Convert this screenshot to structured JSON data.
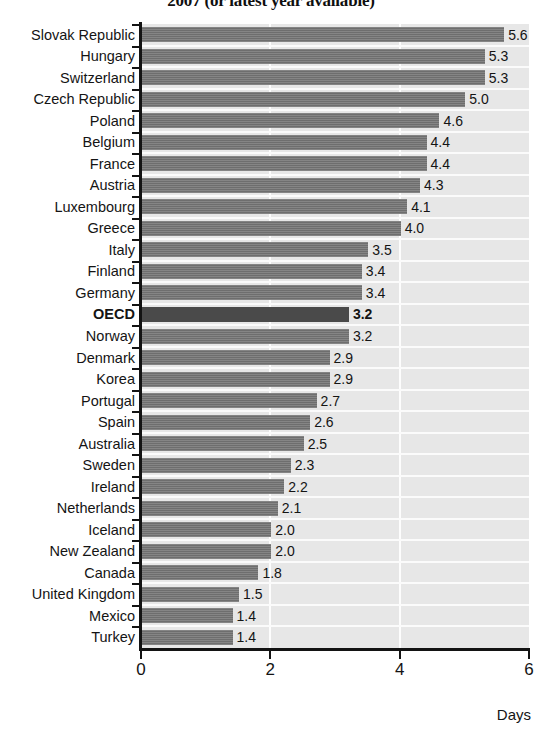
{
  "title": "2007 (or latest year available)",
  "axis": {
    "x_title": "Days",
    "ticks": [
      "0",
      "2",
      "4",
      "6"
    ],
    "tick_values": [
      0,
      2,
      4,
      6
    ],
    "min": 0,
    "max": 6
  },
  "colors": {
    "bar": "#6e6e6e",
    "bar_highlight": "#4a4a4a",
    "plot_background": "#e7e7e7",
    "grid": "#fdfdfd",
    "axis": "#131313",
    "text": "#141414"
  },
  "chart_data": {
    "type": "bar",
    "orientation": "horizontal",
    "title": "2007 (or latest year available)",
    "xlabel": "Days",
    "ylabel": "",
    "xlim": [
      0,
      6
    ],
    "xticks": [
      0,
      2,
      4,
      6
    ],
    "grid": true,
    "legend": "none",
    "highlight_category": "OECD",
    "categories": [
      "Slovak Republic",
      "Hungary",
      "Switzerland",
      "Czech Republic",
      "Poland",
      "Belgium",
      "France",
      "Austria",
      "Luxembourg",
      "Greece",
      "Italy",
      "Finland",
      "Germany",
      "OECD",
      "Norway",
      "Denmark",
      "Korea",
      "Portugal",
      "Spain",
      "Australia",
      "Sweden",
      "Ireland",
      "Netherlands",
      "Iceland",
      "New Zealand",
      "Canada",
      "United Kingdom",
      "Mexico",
      "Turkey"
    ],
    "values": [
      5.6,
      5.3,
      5.3,
      5.0,
      4.6,
      4.4,
      4.4,
      4.3,
      4.1,
      4.0,
      3.5,
      3.4,
      3.4,
      3.2,
      3.2,
      2.9,
      2.9,
      2.7,
      2.6,
      2.5,
      2.3,
      2.2,
      2.1,
      2.0,
      2.0,
      1.8,
      1.5,
      1.4,
      1.4
    ],
    "value_labels": [
      "5.6",
      "5.3",
      "5.3",
      "5.0",
      "4.6",
      "4.4",
      "4.4",
      "4.3",
      "4.1",
      "4.0",
      "3.5",
      "3.4",
      "3.4",
      "3.2",
      "3.2",
      "2.9",
      "2.9",
      "2.7",
      "2.6",
      "2.5",
      "2.3",
      "2.2",
      "2.1",
      "2.0",
      "2.0",
      "1.8",
      "1.5",
      "1.4",
      "1.4"
    ]
  }
}
